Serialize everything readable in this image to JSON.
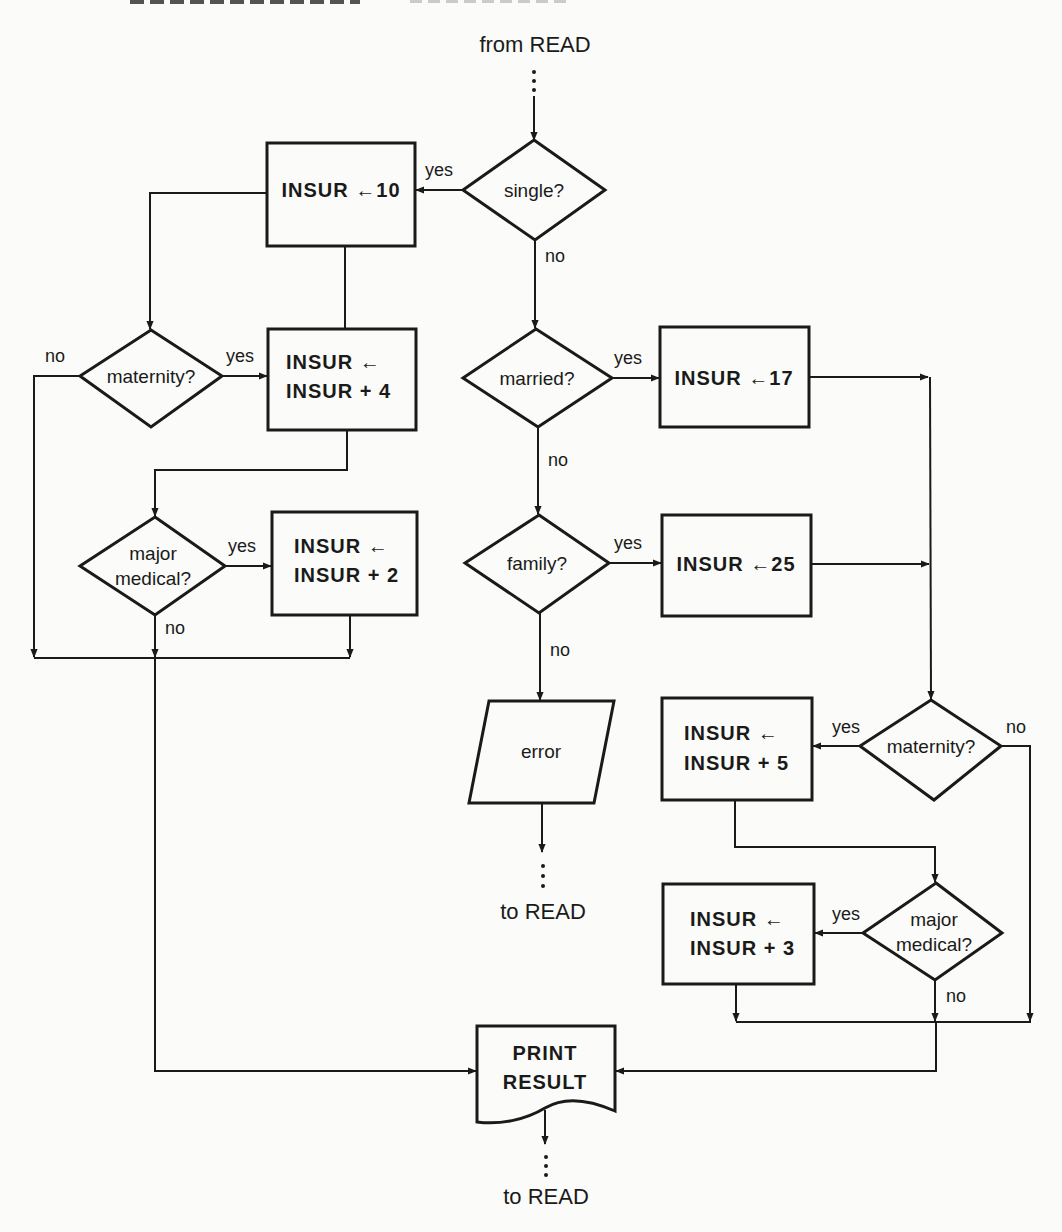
{
  "diagram": {
    "type": "flowchart",
    "terminals": {
      "start": "from READ",
      "error_exit": "to READ",
      "end": "to READ"
    },
    "decisions": {
      "single": "single?",
      "married": "married?",
      "family": "family?",
      "maternity_left": "maternity?",
      "major_medical_left_l1": "major",
      "major_medical_left_l2": "medical?",
      "maternity_right": "maternity?",
      "major_medical_right_l1": "major",
      "major_medical_right_l2": "medical?"
    },
    "processes": {
      "insur10": "INSUR ←10",
      "insur_plus4_l1": "INSUR ←",
      "insur_plus4_l2": "INSUR + 4",
      "insur_plus2_l1": "INSUR ←",
      "insur_plus2_l2": "INSUR + 2",
      "insur17": "INSUR ←17",
      "insur25": "INSUR ←25",
      "insur_plus5_l1": "INSUR ←",
      "insur_plus5_l2": "INSUR + 5",
      "insur_plus3_l1": "INSUR ←",
      "insur_plus3_l2": "INSUR + 3"
    },
    "io": {
      "error": "error"
    },
    "document": {
      "print_l1": "PRINT",
      "print_l2": "RESULT"
    },
    "edge_labels": {
      "single_yes": "yes",
      "single_no": "no",
      "married_yes": "yes",
      "married_no": "no",
      "family_yes": "yes",
      "family_no": "no",
      "maternity_left_yes": "yes",
      "maternity_left_no": "no",
      "major_medical_left_yes": "yes",
      "major_medical_left_no": "no",
      "maternity_right_yes": "yes",
      "maternity_right_no": "no",
      "major_medical_right_yes": "yes",
      "major_medical_right_no": "no"
    },
    "flows": [
      {
        "from": "from READ",
        "to": "single?"
      },
      {
        "from": "single?",
        "to": "INSUR ←10",
        "label": "yes"
      },
      {
        "from": "single?",
        "to": "married?",
        "label": "no"
      },
      {
        "from": "INSUR ←10",
        "to": "maternity? (left)"
      },
      {
        "from": "maternity? (left)",
        "to": "INSUR ← INSUR + 4",
        "label": "yes"
      },
      {
        "from": "maternity? (left)",
        "to": "PRINT RESULT",
        "label": "no"
      },
      {
        "from": "INSUR ← INSUR + 4",
        "to": "major medical? (left)"
      },
      {
        "from": "major medical? (left)",
        "to": "INSUR ← INSUR + 2",
        "label": "yes"
      },
      {
        "from": "major medical? (left)",
        "to": "PRINT RESULT",
        "label": "no"
      },
      {
        "from": "INSUR ← INSUR + 2",
        "to": "PRINT RESULT"
      },
      {
        "from": "married?",
        "to": "INSUR ←17",
        "label": "yes"
      },
      {
        "from": "married?",
        "to": "family?",
        "label": "no"
      },
      {
        "from": "family?",
        "to": "INSUR ←25",
        "label": "yes"
      },
      {
        "from": "family?",
        "to": "error",
        "label": "no"
      },
      {
        "from": "error",
        "to": "to READ"
      },
      {
        "from": "INSUR ←17",
        "to": "maternity? (right)"
      },
      {
        "from": "INSUR ←25",
        "to": "maternity? (right)"
      },
      {
        "from": "maternity? (right)",
        "to": "INSUR ← INSUR + 5",
        "label": "yes"
      },
      {
        "from": "maternity? (right)",
        "to": "PRINT RESULT",
        "label": "no"
      },
      {
        "from": "INSUR ← INSUR + 5",
        "to": "major medical? (right)"
      },
      {
        "from": "major medical? (right)",
        "to": "INSUR ← INSUR + 3",
        "label": "yes"
      },
      {
        "from": "major medical? (right)",
        "to": "PRINT RESULT",
        "label": "no"
      },
      {
        "from": "INSUR ← INSUR + 3",
        "to": "PRINT RESULT"
      },
      {
        "from": "PRINT RESULT",
        "to": "to READ"
      }
    ]
  },
  "colors": {
    "ink": "#1a1a1a",
    "paper": "#fbfbf9"
  }
}
